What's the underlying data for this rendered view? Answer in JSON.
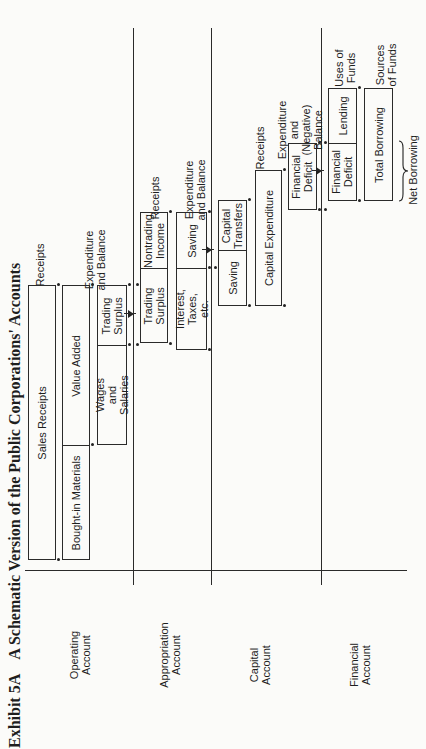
{
  "title": {
    "number": "Exhibit 5A",
    "text": "A Schematic Version of the Public Corporations' Accounts"
  },
  "accounts": {
    "operating": "Operating Account",
    "appropriation": "Appropriation Account",
    "capital": "Capital Account",
    "financial": "Financial Account"
  },
  "column_headings": {
    "operating_receipts": "Receipts",
    "operating_expenditure": "Expenditure and Balance",
    "appropriation_receipts": "Receipts",
    "appropriation_expenditure": "Expenditure and Balance",
    "capital_receipts": "Receipts",
    "capital_expenditure": "Expenditure and (Negative) Balance",
    "financial_uses": "Uses of Funds",
    "financial_sources": "Sources of Funds"
  },
  "boxes": {
    "sales_receipts": "Sales Receipts",
    "bought_in_materials": "Bought-in Materials",
    "value_added": "Value Added",
    "wages_and_salaries": "Wages and Salaries",
    "trading_surplus_op": "Trading Surplus",
    "trading_surplus_app": "Trading Surplus",
    "nontrading_income": "Nontrading Income",
    "interest_taxes": "Interest, Taxes, etc.",
    "saving_app": "Saving",
    "saving_cap": "Saving",
    "capital_transfers": "Capital Transfers",
    "capital_expenditure": "Capital Expenditure",
    "financial_deficit_cap": "Financial Deficit",
    "financial_deficit_fin": "Financial Deficit",
    "lending": "Lending",
    "total_borrowing": "Total Borrowing"
  },
  "annotations": {
    "net_borrowing": "Net Borrowing"
  }
}
